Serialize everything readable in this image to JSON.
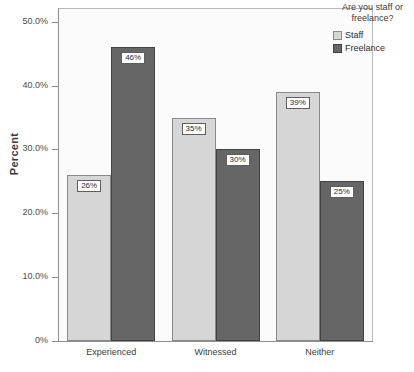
{
  "chart_data": {
    "type": "bar",
    "title": "",
    "xlabel": "",
    "ylabel": "Percent",
    "categories": [
      "Experienced",
      "Witnessed",
      "Neither"
    ],
    "series": [
      {
        "name": "Staff",
        "values": [
          26,
          35,
          39
        ],
        "color": "#d6d6d6"
      },
      {
        "name": "Freelance",
        "values": [
          46,
          30,
          25
        ],
        "color": "#666666"
      }
    ],
    "data_labels": [
      [
        "26%",
        "35%",
        "39%"
      ],
      [
        "46%",
        "30%",
        "25%"
      ]
    ],
    "ylim": [
      0,
      52
    ],
    "ytick_values": [
      0,
      10,
      20,
      30,
      40,
      50
    ],
    "ytick_labels": [
      "0%",
      "10.0%",
      "20.0%",
      "30.0%",
      "40.0%",
      "50.0%"
    ],
    "grid": false,
    "legend_position": "right"
  },
  "legend": {
    "title": "Are you staff or freelance?",
    "entries": [
      {
        "label": "Staff"
      },
      {
        "label": "Freelance"
      }
    ]
  }
}
